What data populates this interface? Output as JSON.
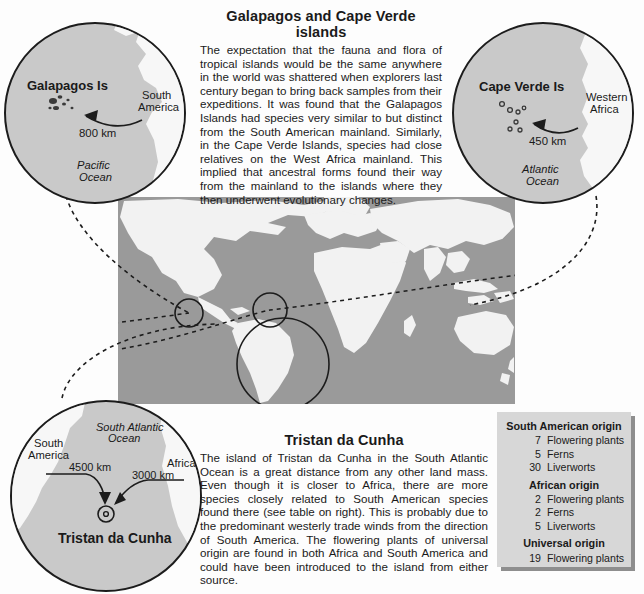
{
  "figure": {
    "title": "Galapagos and Cape Verde islands",
    "kind": "biogeography-diagram"
  },
  "top_block": {
    "heading": "Galapagos and Cape Verde islands",
    "body": "The expectation that the fauna and flora of tropical islands would be the same anywhere in the world was shattered when explorers last century began to bring back samples from their expeditions. It was found that the Galapagos Islands had species very similar to but distinct from the South American mainland. Similarly, in the Cape Verde Islands, species had close relatives on the West Africa mainland. This implied that ancestral forms found their way from the mainland to the islands where they then underwent evolutionary changes."
  },
  "bottom_block": {
    "heading": "Tristan da Cunha",
    "body": "The island of Tristan da Cunha in the South Atlantic Ocean is a great distance from any other land mass.  Even though it is closer to Africa, there are more species closely related to South American species found there (see table on right). This is probably due to the predominant westerly trade winds from the direction of South America. The flowering plants of universal origin are found in both Africa and South America and could have been introduced to the island from either source."
  },
  "inset_galapagos": {
    "island_label": "Galapagos Is",
    "mainland_label_line1": "South",
    "mainland_label_line2": "America",
    "distance": "800 km",
    "ocean_line1": "Pacific",
    "ocean_line2": "Ocean"
  },
  "inset_capeverde": {
    "island_label": "Cape Verde Is",
    "mainland_label_line1": "Western",
    "mainland_label_line2": "Africa",
    "distance": "450 km",
    "ocean_line1": "Atlantic",
    "ocean_line2": "Ocean"
  },
  "inset_tristan": {
    "island_label": "Tristan da Cunha",
    "ocean_line1": "South Atlantic",
    "ocean_line2": "Ocean",
    "west_label_line1": "South",
    "west_label_line2": "America",
    "east_label": "Africa",
    "distance_west": "4500 km",
    "distance_east": "3000 km"
  },
  "species_table": {
    "groups": [
      {
        "heading": "South American origin",
        "rows": [
          {
            "count": "7",
            "name": "Flowering plants"
          },
          {
            "count": "5",
            "name": "Ferns"
          },
          {
            "count": "30",
            "name": "Liverworts"
          }
        ]
      },
      {
        "heading": "African origin",
        "rows": [
          {
            "count": "2",
            "name": "Flowering plants"
          },
          {
            "count": "2",
            "name": "Ferns"
          },
          {
            "count": "5",
            "name": "Liverworts"
          }
        ]
      },
      {
        "heading": "Universal origin",
        "rows": [
          {
            "count": "19",
            "name": "Flowering plants"
          }
        ]
      }
    ]
  },
  "colors": {
    "ocean": "#9a9a9a",
    "land": "#f2f2f2",
    "inset_fill": "#c9c9c9",
    "table_bg": "#d7d7d7",
    "ink": "#1c1c1c"
  }
}
